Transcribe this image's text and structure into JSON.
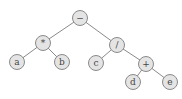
{
  "diagram": {
    "type": "expression-tree",
    "nodes": [
      {
        "id": "root",
        "label": "−",
        "x": 80,
        "y": 18
      },
      {
        "id": "mul",
        "label": "*",
        "x": 43,
        "y": 43
      },
      {
        "id": "div",
        "label": "/",
        "x": 117,
        "y": 45
      },
      {
        "id": "a",
        "label": "a",
        "x": 17,
        "y": 62
      },
      {
        "id": "b",
        "label": "b",
        "x": 62,
        "y": 62
      },
      {
        "id": "c",
        "label": "c",
        "x": 96,
        "y": 63
      },
      {
        "id": "plus",
        "label": "+",
        "x": 146,
        "y": 64
      },
      {
        "id": "d",
        "label": "d",
        "x": 133,
        "y": 82
      },
      {
        "id": "e",
        "label": "e",
        "x": 170,
        "y": 82
      }
    ],
    "edges": [
      [
        "root",
        "mul"
      ],
      [
        "root",
        "div"
      ],
      [
        "mul",
        "a"
      ],
      [
        "mul",
        "b"
      ],
      [
        "div",
        "c"
      ],
      [
        "div",
        "plus"
      ],
      [
        "plus",
        "d"
      ],
      [
        "plus",
        "e"
      ]
    ]
  }
}
